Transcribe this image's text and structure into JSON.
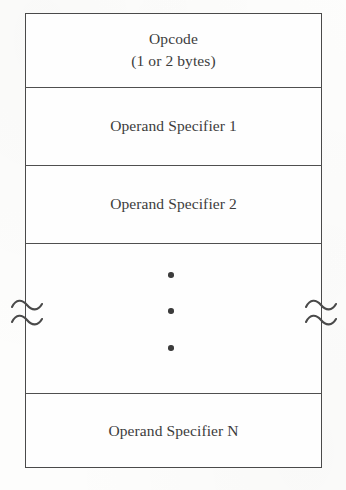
{
  "diagram": {
    "ink_color": "#3c3c3c",
    "rule_color": "#4a4a4a",
    "paper_color": "#fdfdfc",
    "fields": [
      {
        "id": "opcode",
        "label": "Opcode",
        "sublabel": "(1 or 2 bytes)"
      },
      {
        "id": "operand-specifier-1",
        "label": "Operand Specifier 1"
      },
      {
        "id": "operand-specifier-2",
        "label": "Operand Specifier 2"
      },
      {
        "id": "continuation",
        "label": "",
        "ellipsis_dot_count": 3,
        "break_marks": [
          "tilde-break-left",
          "tilde-break-right"
        ]
      },
      {
        "id": "operand-specifier-n",
        "label": "Operand Specifier N"
      }
    ]
  }
}
